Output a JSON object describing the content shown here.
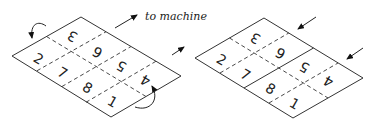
{
  "label": "to machine",
  "left_sheet": {
    "description": "Unfolded sheet with 8 page panels, curved arrows indicating flip",
    "panels": [
      "3",
      "6",
      "5",
      "4",
      "2",
      "7",
      "8",
      "1"
    ]
  },
  "right_sheet": {
    "description": "Sheet with inward arrows",
    "panels": [
      "3",
      "6",
      "5",
      "4",
      "2",
      "7",
      "8",
      "1"
    ]
  }
}
